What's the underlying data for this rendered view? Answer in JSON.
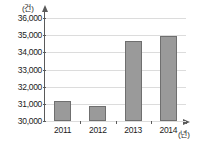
{
  "chart_data": {
    "type": "bar",
    "title": "",
    "subtitle": "",
    "xlabel": "(년)",
    "ylabel": "(건)",
    "categories": [
      "2011",
      "2012",
      "2013",
      "2014"
    ],
    "values": [
      31150,
      30850,
      34650,
      34950
    ],
    "series": [
      {
        "name": "건수",
        "values": [
          31150,
          30850,
          34650,
          34950
        ]
      }
    ],
    "ylim": [
      30000,
      36000
    ],
    "ytick_values": [
      30000,
      31000,
      32000,
      33000,
      34000,
      35000,
      36000
    ],
    "ytick_labels": [
      "30,000",
      "31,000",
      "32,000",
      "33,000",
      "34,000",
      "35,000",
      "36,000"
    ],
    "xtick_labels": [
      "2011",
      "2012",
      "2013",
      "2014"
    ],
    "grid": true,
    "grid_axis": "y",
    "legend": false,
    "legend_position": "none",
    "bar_color": "#9a9a9a",
    "bar_edge_color": "#6f6f6f",
    "grid_color": "#dcdcdc",
    "axis_color": "#5a5a5a",
    "background_color": "#ffffff",
    "y_axis_arrow": true,
    "x_axis_arrow": true,
    "annotations": []
  }
}
